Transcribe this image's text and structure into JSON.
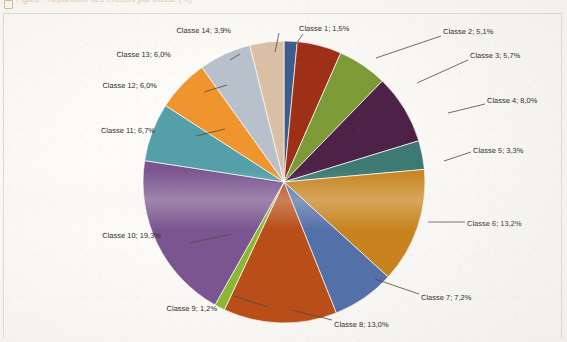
{
  "caption": {
    "text": "Figure : Répartition des effectifs par classe (%)",
    "marker_icon": "bullet-square-icon"
  },
  "chart_data": {
    "type": "pie",
    "title": "",
    "units": "%",
    "legend_position": "none",
    "label_format": "{name}; {value}%",
    "categories": [
      "Classe 1",
      "Classe 2",
      "Classe 3",
      "Classe 4",
      "Classe 5",
      "Classe 6",
      "Classe 7",
      "Classe 8",
      "Classe 9",
      "Classe 10",
      "Classe 11",
      "Classe 12",
      "Classe 13",
      "Classe 14"
    ],
    "values": [
      1.5,
      5.1,
      5.7,
      8.0,
      3.3,
      13.2,
      7.2,
      13.0,
      1.2,
      19.3,
      6.7,
      6.0,
      6.0,
      3.9
    ],
    "value_labels": [
      "1,5%",
      "5,1%",
      "5,7%",
      "8,0%",
      "3,3%",
      "13,2%",
      "7,2%",
      "13,0%",
      "1,2%",
      "19,3%",
      "6,7%",
      "6,0%",
      "6,0%",
      "3,9%"
    ],
    "colors": [
      "#3f5c8c",
      "#9e3018",
      "#7c9a35",
      "#4e2148",
      "#3d7a73",
      "#c8831e",
      "#5470a8",
      "#b94e18",
      "#8bb833",
      "#7a5590",
      "#55a0a8",
      "#f0952e",
      "#b8c0cc",
      "#d9c0a5"
    ],
    "labels": [
      {
        "name": "Classe 1",
        "text": "Classe 1; 1,5%",
        "color": "#3f5c8c"
      },
      {
        "name": "Classe 2",
        "text": "Classe 2; 5,1%",
        "color": "#9e3018"
      },
      {
        "name": "Classe 3",
        "text": "Classe 3; 5,7%",
        "color": "#7c9a35"
      },
      {
        "name": "Classe 4",
        "text": "Classe 4; 8,0%",
        "color": "#4e2148"
      },
      {
        "name": "Classe 5",
        "text": "Classe 5; 3,3%",
        "color": "#3d7a73"
      },
      {
        "name": "Classe 6",
        "text": "Classe 6; 13,2%",
        "color": "#c8831e"
      },
      {
        "name": "Classe 7",
        "text": "Classe 7; 7,2%",
        "color": "#5470a8"
      },
      {
        "name": "Classe 8",
        "text": "Classe 8; 13,0%",
        "color": "#b94e18"
      },
      {
        "name": "Classe 9",
        "text": "Classe 9; 1,2%",
        "color": "#8bb833"
      },
      {
        "name": "Classe 10",
        "text": "Classe 10; 19,3%",
        "color": "#7a5590"
      },
      {
        "name": "Classe 11",
        "text": "Classe 11; 6,7%",
        "color": "#55a0a8"
      },
      {
        "name": "Classe 12",
        "text": "Classe 12; 6,0%",
        "color": "#f0952e"
      },
      {
        "name": "Classe 13",
        "text": "Classe 13; 6,0%",
        "color": "#b8c0cc"
      },
      {
        "name": "Classe 14",
        "text": "Classe 14; 3,9%",
        "color": "#d9c0a5"
      }
    ]
  },
  "geometry": {
    "cx": 284,
    "cy": 182,
    "r": 141,
    "start_angle_deg": -90,
    "label_positions": [
      {
        "x": 299,
        "y": 25,
        "anchor": "left",
        "lx1": 303,
        "ly1": 34,
        "lx2": 296,
        "ly2": 44
      },
      {
        "x": 443,
        "y": 28,
        "anchor": "left",
        "lx1": 441,
        "ly1": 36,
        "lx2": 376,
        "ly2": 58
      },
      {
        "x": 470,
        "y": 52,
        "anchor": "left",
        "lx1": 468,
        "ly1": 60,
        "lx2": 417,
        "ly2": 83
      },
      {
        "x": 487,
        "y": 97,
        "anchor": "left",
        "lx1": 485,
        "ly1": 104,
        "lx2": 448,
        "ly2": 113
      },
      {
        "x": 473,
        "y": 147,
        "anchor": "left",
        "lx1": 471,
        "ly1": 152,
        "lx2": 444,
        "ly2": 161
      },
      {
        "x": 467,
        "y": 220,
        "anchor": "left",
        "lx1": 465,
        "ly1": 222,
        "lx2": 428,
        "ly2": 222
      },
      {
        "x": 421,
        "y": 294,
        "anchor": "left",
        "lx1": 419,
        "ly1": 294,
        "lx2": 375,
        "ly2": 279
      },
      {
        "x": 334,
        "y": 321,
        "anchor": "left",
        "lx1": 332,
        "ly1": 320,
        "lx2": 292,
        "ly2": 310
      },
      {
        "x": 217,
        "y": 305,
        "anchor": "right",
        "lx1": 268,
        "ly1": 307,
        "lx2": 234,
        "ly2": 296
      },
      {
        "x": 161,
        "y": 232,
        "anchor": "right",
        "lx1": 231,
        "ly1": 234,
        "lx2": 190,
        "ly2": 243
      },
      {
        "x": 155,
        "y": 127,
        "anchor": "right",
        "lx1": 225,
        "ly1": 129,
        "lx2": 196,
        "ly2": 136
      },
      {
        "x": 157,
        "y": 82,
        "anchor": "right",
        "lx1": 227,
        "ly1": 85,
        "lx2": 204,
        "ly2": 92
      },
      {
        "x": 171,
        "y": 51,
        "anchor": "right",
        "lx1": 240,
        "ly1": 54,
        "lx2": 230,
        "ly2": 60
      },
      {
        "x": 231,
        "y": 27,
        "anchor": "right",
        "lx1": 279,
        "ly1": 33,
        "lx2": 275,
        "ly2": 52
      }
    ]
  }
}
